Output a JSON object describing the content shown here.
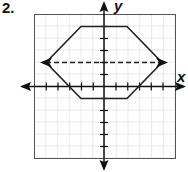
{
  "problem_number": "2.",
  "axes": {
    "x_label": "x",
    "y_label": "y",
    "x_range": [
      -6,
      6
    ],
    "y_range": [
      -6,
      6
    ],
    "grid": "dotted, 1 unit spacing"
  },
  "figure": {
    "shape": "hexagon",
    "vertices": [
      [
        -2,
        5
      ],
      [
        2,
        5
      ],
      [
        5,
        2
      ],
      [
        2,
        -1
      ],
      [
        -2,
        -1
      ],
      [
        -5,
        2
      ]
    ],
    "line_of_symmetry": {
      "style": "dashed",
      "from": [
        -5,
        2
      ],
      "to": [
        5,
        2
      ]
    },
    "colors": {
      "stroke": "#222222",
      "grid": "#888888",
      "frame": "#555555"
    }
  }
}
